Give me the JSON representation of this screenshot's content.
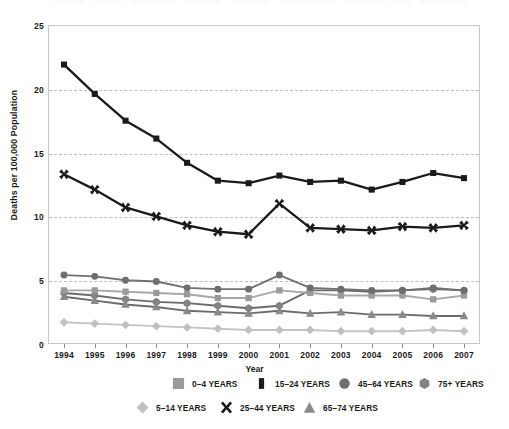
{
  "chart_data": {
    "type": "line",
    "title": "",
    "xlabel": "Year",
    "ylabel": "Deaths per 100,000 Population",
    "grid": true,
    "legend_position": "bottom",
    "xlim": [
      1994,
      2007
    ],
    "ylim": [
      0,
      25
    ],
    "yticks": [
      "0",
      "5",
      "10",
      "15",
      "20",
      "25"
    ],
    "ytick_values": [
      0,
      5,
      10,
      15,
      20,
      25
    ],
    "categories": [
      "1994",
      "1995",
      "1996",
      "1997",
      "1998",
      "1999",
      "2000",
      "2001",
      "2002",
      "2003",
      "2004",
      "2005",
      "2006",
      "2007"
    ],
    "series": [
      {
        "name": "0–4 YEARS",
        "marker": "square",
        "color": "#9a9a9a",
        "line_color": "#a8a8a8",
        "values": [
          4.2,
          4.2,
          4.1,
          4.0,
          3.9,
          3.6,
          3.6,
          4.2,
          4.0,
          3.8,
          3.8,
          3.8,
          3.5,
          3.8
        ]
      },
      {
        "name": "5–14 YEARS",
        "marker": "diamond",
        "color": "#c0c0c0",
        "line_color": "#c4c4c4",
        "values": [
          1.7,
          1.6,
          1.5,
          1.4,
          1.3,
          1.2,
          1.1,
          1.1,
          1.1,
          1.0,
          1.0,
          1.0,
          1.1,
          1.0
        ]
      },
      {
        "name": "15–24 YEARS",
        "marker": "square",
        "color": "#1a1a1a",
        "line_color": "#1a1a1a",
        "values": [
          21.9,
          19.6,
          17.5,
          16.1,
          14.2,
          12.8,
          12.6,
          13.2,
          12.7,
          12.8,
          12.1,
          12.7,
          13.4,
          13.0
        ]
      },
      {
        "name": "25–44 YEARS",
        "marker": "x",
        "color": "#1a1a1a",
        "line_color": "#1a1a1a",
        "values": [
          13.3,
          12.1,
          10.7,
          10.0,
          9.3,
          8.8,
          8.6,
          11.0,
          9.1,
          9.0,
          8.9,
          9.2,
          9.1,
          9.3
        ]
      },
      {
        "name": "45–64 YEARS",
        "marker": "circle",
        "color": "#6e6e6e",
        "line_color": "#717171",
        "values": [
          5.4,
          5.3,
          5.0,
          4.9,
          4.4,
          4.3,
          4.3,
          5.4,
          4.4,
          4.3,
          4.2,
          4.2,
          4.4,
          4.2
        ]
      },
      {
        "name": "65–74 YEARS",
        "marker": "triangle",
        "color": "#8a8a8a",
        "line_color": "#6b6b6b",
        "values": [
          3.7,
          3.4,
          3.1,
          2.9,
          2.6,
          2.5,
          2.4,
          2.6,
          2.4,
          2.5,
          2.3,
          2.3,
          2.2,
          2.2
        ]
      },
      {
        "name": "75+ YEARS",
        "marker": "hexagon",
        "color": "#838383",
        "line_color": "#6b6b6b",
        "values": [
          4.0,
          3.8,
          3.5,
          3.3,
          3.2,
          3.0,
          2.8,
          3.0,
          4.2,
          4.2,
          4.1,
          4.2,
          4.3,
          4.2
        ]
      }
    ]
  },
  "legend": {
    "row1": [
      {
        "label": "0–4 YEARS",
        "marker": "square",
        "color": "#9a9a9a"
      },
      {
        "label": "15–24 YEARS",
        "marker": "square",
        "color": "#1a1a1a"
      },
      {
        "label": "45–64 YEARS",
        "marker": "circle",
        "color": "#6e6e6e"
      },
      {
        "label": "75+ YEARS",
        "marker": "hexagon",
        "color": "#838383"
      }
    ],
    "row2": [
      {
        "label": "5–14 YEARS",
        "marker": "diamond",
        "color": "#c0c0c0"
      },
      {
        "label": "25–44 YEARS",
        "marker": "x",
        "color": "#1a1a1a"
      },
      {
        "label": "65–74 YEARS",
        "marker": "triangle",
        "color": "#8a8a8a"
      }
    ]
  }
}
